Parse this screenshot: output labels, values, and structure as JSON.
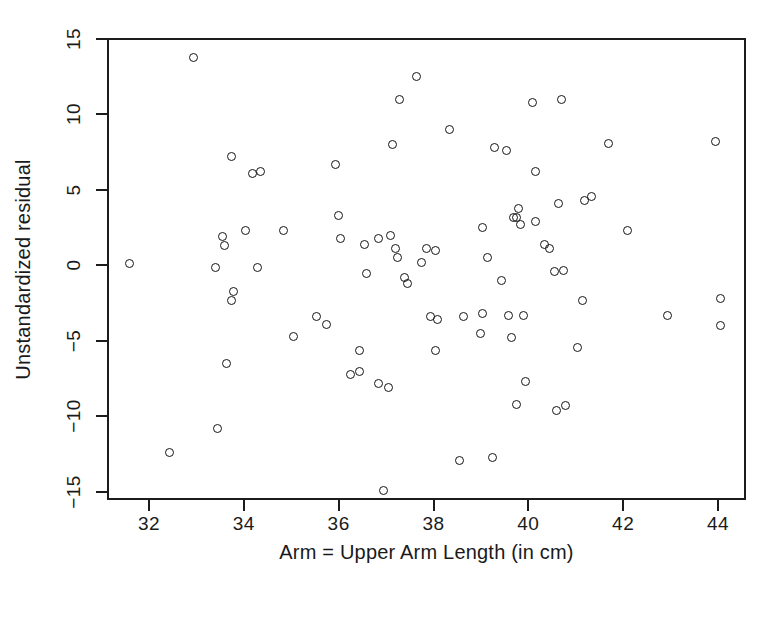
{
  "chart_data": {
    "type": "scatter",
    "title": "",
    "xlabel": "Arm = Upper Arm Length (in cm)",
    "ylabel": "Unstandardized residual",
    "xlim": [
      31.2,
      44.6
    ],
    "ylim": [
      -15.8,
      15.3
    ],
    "xticks": [
      32,
      34,
      36,
      38,
      40,
      42,
      44
    ],
    "xticklabels": [
      "32",
      "34",
      "36",
      "38",
      "40",
      "42",
      "44"
    ],
    "yticks": [
      15,
      10,
      5,
      0,
      -5,
      -10,
      -15
    ],
    "yticklabels": [
      "15",
      "10",
      "5",
      "0",
      "-5",
      "-10",
      "-15"
    ],
    "grid": false,
    "legend": null,
    "marker": "open-circle",
    "marker_color": "#151515",
    "n_points": 97,
    "points": [
      [
        31.55,
        0.2
      ],
      [
        32.4,
        -12.3
      ],
      [
        32.9,
        13.9
      ],
      [
        33.35,
        0.0
      ],
      [
        33.4,
        -10.7
      ],
      [
        33.5,
        2.0
      ],
      [
        33.55,
        1.4
      ],
      [
        33.6,
        -6.4
      ],
      [
        33.7,
        7.3
      ],
      [
        33.7,
        -2.2
      ],
      [
        33.75,
        -1.6
      ],
      [
        34.0,
        2.4
      ],
      [
        34.15,
        6.2
      ],
      [
        34.3,
        6.3
      ],
      [
        34.25,
        0.0
      ],
      [
        34.8,
        2.4
      ],
      [
        35.0,
        -4.6
      ],
      [
        35.5,
        -3.3
      ],
      [
        35.7,
        -3.8
      ],
      [
        35.9,
        6.8
      ],
      [
        35.95,
        3.4
      ],
      [
        36.0,
        1.9
      ],
      [
        36.2,
        -7.1
      ],
      [
        36.4,
        -6.9
      ],
      [
        36.4,
        -5.5
      ],
      [
        36.5,
        1.5
      ],
      [
        36.55,
        -0.4
      ],
      [
        36.8,
        -7.7
      ],
      [
        36.8,
        1.9
      ],
      [
        36.9,
        -14.8
      ],
      [
        37.0,
        -8.0
      ],
      [
        37.05,
        2.1
      ],
      [
        37.1,
        8.1
      ],
      [
        37.15,
        1.2
      ],
      [
        37.2,
        0.6
      ],
      [
        37.25,
        11.1
      ],
      [
        37.35,
        -0.7
      ],
      [
        37.4,
        -1.1
      ],
      [
        37.6,
        12.6
      ],
      [
        37.7,
        0.3
      ],
      [
        37.8,
        1.2
      ],
      [
        37.9,
        -3.3
      ],
      [
        38.0,
        1.1
      ],
      [
        38.0,
        -5.5
      ],
      [
        38.05,
        -3.5
      ],
      [
        38.3,
        9.1
      ],
      [
        38.5,
        -12.8
      ],
      [
        38.6,
        -3.3
      ],
      [
        38.95,
        -4.4
      ],
      [
        39.0,
        -3.1
      ],
      [
        39.0,
        2.6
      ],
      [
        39.1,
        0.6
      ],
      [
        39.2,
        -12.6
      ],
      [
        39.25,
        7.9
      ],
      [
        39.4,
        -0.9
      ],
      [
        39.5,
        7.7
      ],
      [
        39.55,
        -3.2
      ],
      [
        39.6,
        -4.7
      ],
      [
        39.65,
        3.3
      ],
      [
        39.7,
        3.3
      ],
      [
        39.7,
        -9.1
      ],
      [
        39.75,
        3.9
      ],
      [
        39.8,
        2.8
      ],
      [
        39.85,
        -3.2
      ],
      [
        39.9,
        -7.6
      ],
      [
        40.05,
        10.9
      ],
      [
        40.1,
        6.3
      ],
      [
        40.1,
        3.0
      ],
      [
        40.3,
        1.5
      ],
      [
        40.4,
        1.2
      ],
      [
        40.5,
        -0.3
      ],
      [
        40.55,
        -9.5
      ],
      [
        40.6,
        4.2
      ],
      [
        40.65,
        11.1
      ],
      [
        40.7,
        -0.2
      ],
      [
        40.75,
        -9.2
      ],
      [
        41.0,
        -5.3
      ],
      [
        41.1,
        -2.2
      ],
      [
        41.15,
        4.4
      ],
      [
        41.3,
        4.7
      ],
      [
        41.65,
        8.2
      ],
      [
        42.05,
        2.4
      ],
      [
        42.9,
        -3.2
      ],
      [
        43.9,
        8.3
      ],
      [
        44.0,
        -2.1
      ],
      [
        44.0,
        -3.9
      ]
    ]
  }
}
